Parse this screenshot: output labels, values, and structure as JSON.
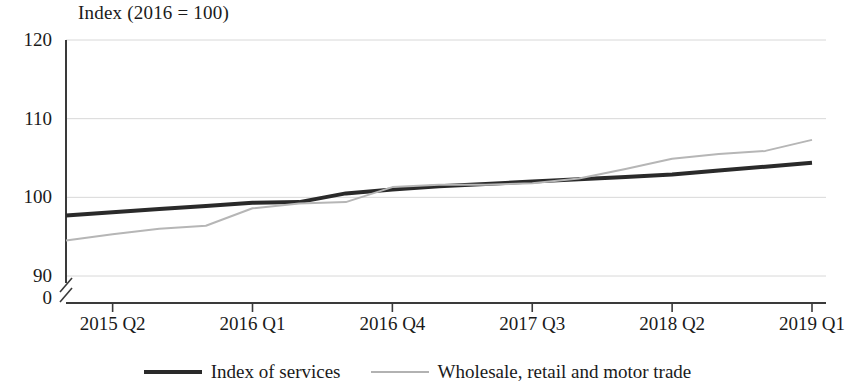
{
  "chart_data": {
    "type": "line",
    "title": "Index (2016 = 100)",
    "xlabel": "",
    "ylabel": "",
    "ylim": [
      90,
      120
    ],
    "yticks": [
      90,
      100,
      110,
      120
    ],
    "y_axis_break": true,
    "y_axis_origin_label": "0",
    "grid": true,
    "legend_position": "bottom",
    "x": [
      "2015 Q1",
      "2015 Q2",
      "2015 Q3",
      "2015 Q4",
      "2016 Q1",
      "2016 Q2",
      "2016 Q3",
      "2016 Q4",
      "2017 Q1",
      "2017 Q2",
      "2017 Q3",
      "2017 Q4",
      "2018 Q1",
      "2018 Q2",
      "2018 Q3",
      "2018 Q4",
      "2019 Q1"
    ],
    "xticks": [
      "2015 Q2",
      "2016 Q1",
      "2016 Q4",
      "2017 Q3",
      "2018 Q2",
      "2019 Q1"
    ],
    "xtick_indices": [
      1,
      4,
      7,
      10,
      13,
      16
    ],
    "series": [
      {
        "name": "Index of services",
        "color": "#2a2a2a",
        "width": 4,
        "style": "solid",
        "values": [
          97.7,
          98.1,
          98.5,
          98.9,
          99.3,
          99.4,
          100.5,
          101.0,
          101.4,
          101.7,
          102.0,
          102.3,
          102.6,
          102.9,
          103.4,
          103.9,
          104.4
        ]
      },
      {
        "name": "Wholesale, retail and motor trade",
        "color": "#b6b6b6",
        "width": 2,
        "style": "solid",
        "values": [
          94.5,
          95.3,
          96.0,
          96.4,
          98.6,
          99.2,
          99.4,
          101.3,
          101.6,
          101.6,
          101.8,
          102.4,
          103.6,
          104.9,
          105.5,
          105.9,
          107.3
        ]
      }
    ]
  },
  "colors": {
    "axis": "#3a3a3a",
    "grid": "#d8d8d8",
    "series_dark": "#2a2a2a",
    "series_light": "#b6b6b6",
    "background": "#ffffff"
  }
}
